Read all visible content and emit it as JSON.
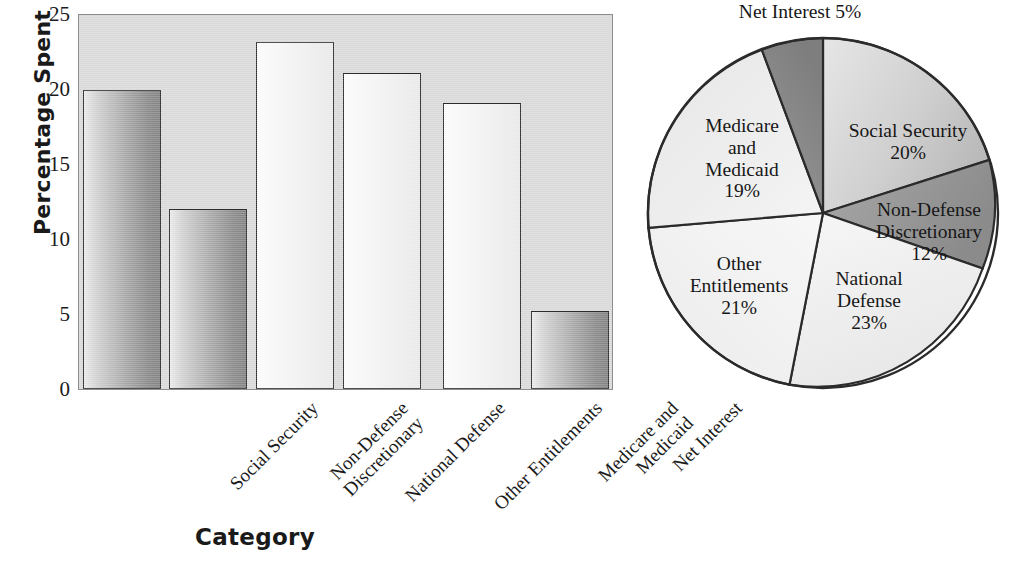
{
  "chart_data": [
    {
      "type": "bar",
      "title": "",
      "xlabel": "Category",
      "ylabel": "Percentage Spent",
      "categories": [
        "Social Security",
        "Non-Defense\nDiscretionary",
        "National Defense",
        "Other Entitlements",
        "Medicare and\nMedicaid",
        "Net Interest"
      ],
      "values": [
        20,
        12,
        23.2,
        21.1,
        19.1,
        5.2
      ],
      "ylim": [
        0,
        25
      ],
      "yticks": [
        "0",
        "5",
        "10",
        "15",
        "20",
        "25"
      ],
      "ytick_values": [
        0,
        5,
        10,
        15,
        20,
        25
      ],
      "grid": false,
      "legend": "none",
      "bar_shading": [
        "dark",
        "dark",
        "light",
        "light",
        "light",
        "dark"
      ],
      "plot_background": "#d9d9d9"
    },
    {
      "type": "pie",
      "title": "",
      "start_angle_deg": 0,
      "direction": "clockwise",
      "labels": [
        "Social Security",
        "Non-Defense\nDiscretionary",
        "National Defense",
        "Other Entitlements",
        "Medicare\nand\nMedicaid",
        "Net Interest"
      ],
      "values": [
        20,
        12,
        23,
        21,
        19,
        5
      ],
      "slice_texts": [
        "Social Security\n20%",
        "Non-Defense\nDiscretionary\n12%",
        "National\nDefense\n23%",
        "Other\nEntitlements\n21%",
        "Medicare\nand\nMedicaid\n19%",
        "Net Interest 5%"
      ],
      "slice_fills": [
        "#d0d0d0",
        "#989898",
        "#f2f2f2",
        "#f4f4f4",
        "#f0f0f0",
        "#8e8e8e"
      ],
      "outside_label_index": 5
    }
  ],
  "bar_chart": {
    "ylabel": "Percentage Spent",
    "xlabel": "Category",
    "yticks": [
      {
        "label": "25",
        "value": 25
      },
      {
        "label": "20",
        "value": 20
      },
      {
        "label": "15",
        "value": 15
      },
      {
        "label": "10",
        "value": 10
      },
      {
        "label": "5",
        "value": 5
      },
      {
        "label": "0",
        "value": 0
      }
    ],
    "bars": [
      {
        "label": "Social Security",
        "value": 20,
        "shade": "dark"
      },
      {
        "label": "Non-Defense\nDiscretionary",
        "value": 12,
        "shade": "dark"
      },
      {
        "label": "National Defense",
        "value": 23.2,
        "shade": "light"
      },
      {
        "label": "Other Entitlements",
        "value": 21.1,
        "shade": "light"
      },
      {
        "label": "Medicare and\nMedicaid",
        "value": 19.1,
        "shade": "light"
      },
      {
        "label": "Net Interest",
        "value": 5.2,
        "shade": "dark"
      }
    ]
  },
  "pie_chart": {
    "outside_label": "Net Interest 5%",
    "slices": [
      {
        "name": "Social Security",
        "text": "Social Security\n20%",
        "percent": 20
      },
      {
        "name": "Non-Defense Discretionary",
        "text": "Non-Defense\nDiscretionary\n12%",
        "percent": 12
      },
      {
        "name": "National Defense",
        "text": "National\nDefense\n23%",
        "percent": 23
      },
      {
        "name": "Other Entitlements",
        "text": "Other\nEntitlements\n21%",
        "percent": 21
      },
      {
        "name": "Medicare and Medicaid",
        "text": "Medicare\nand\nMedicaid\n19%",
        "percent": 19
      },
      {
        "name": "Net Interest",
        "text": "Net Interest 5%",
        "percent": 5
      }
    ]
  },
  "colors": {
    "plot_bg": "#d9d9d9",
    "ink": "#1a1a1a",
    "outline": "#2b2b2b",
    "page_bg": "#ffffff"
  }
}
